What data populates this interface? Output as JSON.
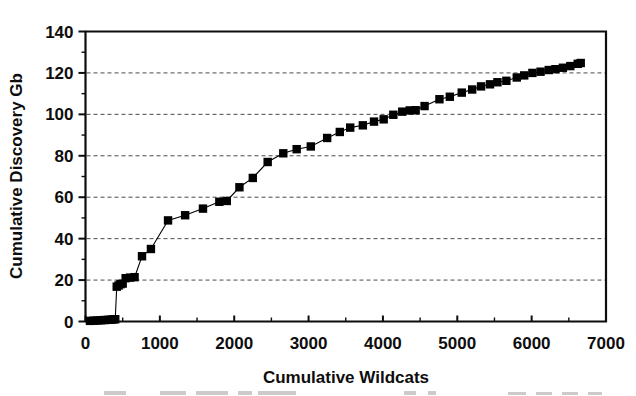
{
  "chart_data": {
    "type": "line",
    "title": "",
    "subtitle": "",
    "xlabel": "Cumulative Wildcats",
    "ylabel": "Cumulative Discovery Gb",
    "xlim": [
      0,
      7000
    ],
    "ylim": [
      0,
      140
    ],
    "xticks": [
      0,
      1000,
      2000,
      3000,
      4000,
      5000,
      6000,
      7000
    ],
    "yticks": [
      0,
      20,
      40,
      60,
      80,
      100,
      120,
      140
    ],
    "xtick_labels": [
      "0",
      "1000",
      "2000",
      "3000",
      "4000",
      "5000",
      "6000",
      "7000"
    ],
    "ytick_labels": [
      "0",
      "20",
      "40",
      "60",
      "80",
      "100",
      "120",
      "140"
    ],
    "x_minor_step": 500,
    "y_minor_step": 10,
    "grid": "horizontal-dashed",
    "legend": "none",
    "marker": "square",
    "marker_color": "#000000",
    "line_color": "#000000",
    "series": [
      {
        "name": "Cumulative discovery",
        "x": [
          60,
          110,
          160,
          210,
          255,
          300,
          340,
          375,
          400,
          420,
          445,
          470,
          500,
          540,
          600,
          660,
          760,
          880,
          1110,
          1340,
          1580,
          1800,
          1900,
          2070,
          2250,
          2450,
          2660,
          2840,
          3030,
          3250,
          3420,
          3560,
          3730,
          3880,
          4010,
          4140,
          4260,
          4360,
          4440,
          4560,
          4760,
          4900,
          5060,
          5200,
          5320,
          5440,
          5540,
          5660,
          5800,
          5900,
          6010,
          6120,
          6230,
          6320,
          6420,
          6520,
          6620,
          6660
        ],
        "y": [
          0.3,
          0.4,
          0.5,
          0.6,
          0.7,
          0.8,
          0.9,
          1.0,
          1.1,
          16.8,
          17.4,
          18.0,
          18.3,
          20.9,
          21.2,
          21.4,
          31.5,
          35.0,
          48.8,
          51.3,
          54.5,
          57.8,
          58.2,
          64.8,
          69.3,
          77.0,
          81.2,
          83.2,
          84.5,
          88.6,
          91.5,
          93.6,
          94.7,
          96.5,
          97.6,
          99.8,
          101.3,
          101.9,
          102.0,
          104.0,
          107.3,
          108.5,
          110.5,
          112.0,
          113.5,
          114.5,
          115.5,
          116.2,
          117.8,
          118.8,
          120.0,
          120.6,
          121.4,
          121.8,
          122.5,
          123.3,
          124.4,
          124.8
        ]
      }
    ]
  },
  "axes": {
    "x_title": "Cumulative Wildcats",
    "y_title": "Cumulative Discovery Gb"
  }
}
